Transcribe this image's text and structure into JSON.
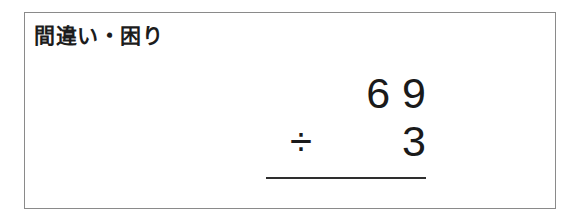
{
  "card": {
    "title": "間違い・困り",
    "border_color": "#8a8a8a",
    "background_color": "#ffffff"
  },
  "problem": {
    "dividend_display": "6 9",
    "dividend": 69,
    "operator_symbol": "÷",
    "operator_name": "division",
    "divisor_display": "3",
    "divisor": 3,
    "answer_display": "",
    "text_color": "#1a1a1a",
    "rule_color": "#2e2e2e"
  }
}
